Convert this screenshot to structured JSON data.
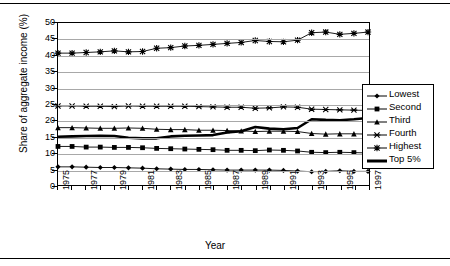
{
  "chart_data": {
    "type": "line",
    "title": "",
    "xlabel": "Year",
    "ylabel": "Share of aggregate income (%)",
    "ylim": [
      0,
      50
    ],
    "ytick_step": 5,
    "yticks": [
      0,
      5,
      10,
      15,
      20,
      25,
      30,
      35,
      40,
      45,
      50
    ],
    "grid": true,
    "legend_position": "right",
    "x": [
      1975,
      1976,
      1977,
      1978,
      1979,
      1980,
      1981,
      1982,
      1983,
      1984,
      1985,
      1986,
      1987,
      1988,
      1989,
      1990,
      1991,
      1992,
      1993,
      1994,
      1995,
      1996,
      1997
    ],
    "xtick_labels": [
      "1975",
      "",
      "1977",
      "",
      "1979",
      "",
      "1981",
      "",
      "1983",
      "",
      "1985",
      "",
      "1987",
      "",
      "1989",
      "",
      "1991",
      "",
      "1993",
      "",
      "1995",
      "",
      "1997"
    ],
    "series": [
      {
        "name": "Lowest",
        "marker": "diamond",
        "values": [
          5.6,
          5.6,
          5.5,
          5.4,
          5.4,
          5.3,
          5.2,
          5.0,
          4.9,
          4.8,
          4.8,
          4.7,
          4.6,
          4.6,
          4.6,
          4.6,
          4.5,
          4.3,
          4.1,
          4.2,
          4.4,
          4.2,
          4.2
        ]
      },
      {
        "name": "Second",
        "marker": "square",
        "values": [
          11.9,
          11.9,
          11.7,
          11.7,
          11.6,
          11.6,
          11.5,
          11.3,
          11.2,
          11.1,
          11.0,
          10.9,
          10.7,
          10.7,
          10.6,
          10.8,
          10.7,
          10.5,
          10.1,
          10.0,
          10.1,
          10.0,
          9.9
        ]
      },
      {
        "name": "Third",
        "marker": "triangle",
        "values": [
          17.7,
          17.7,
          17.6,
          17.5,
          17.5,
          17.6,
          17.5,
          17.2,
          17.1,
          17.1,
          16.9,
          16.9,
          16.8,
          16.7,
          16.5,
          16.6,
          16.6,
          16.5,
          15.9,
          15.7,
          15.8,
          15.8,
          15.7
        ]
      },
      {
        "name": "Fourth",
        "marker": "x-bar",
        "values": [
          24.4,
          24.4,
          24.3,
          24.3,
          24.2,
          24.4,
          24.3,
          24.3,
          24.3,
          24.3,
          24.2,
          24.1,
          24.0,
          24.0,
          23.7,
          23.8,
          24.1,
          24.0,
          23.4,
          23.3,
          23.2,
          23.1,
          23.0
        ]
      },
      {
        "name": "Highest",
        "marker": "asterisk",
        "values": [
          40.7,
          40.7,
          40.9,
          41.1,
          41.4,
          41.1,
          41.2,
          42.2,
          42.4,
          42.9,
          43.1,
          43.4,
          43.7,
          44.0,
          44.6,
          44.3,
          44.2,
          44.7,
          47.0,
          47.2,
          46.5,
          46.8,
          47.2
        ]
      },
      {
        "name": "Top 5%",
        "marker": "none",
        "thick": true,
        "values": [
          14.9,
          15.0,
          15.1,
          15.2,
          15.1,
          14.6,
          14.4,
          14.4,
          15.0,
          15.2,
          15.3,
          15.4,
          16.2,
          16.6,
          17.9,
          17.4,
          17.2,
          17.6,
          20.3,
          20.1,
          20.0,
          20.3,
          20.7
        ]
      }
    ]
  },
  "legend": {
    "items": [
      {
        "label": "Lowest"
      },
      {
        "label": "Second"
      },
      {
        "label": "Third"
      },
      {
        "label": "Fourth"
      },
      {
        "label": "Highest"
      },
      {
        "label": "Top 5%"
      }
    ]
  }
}
